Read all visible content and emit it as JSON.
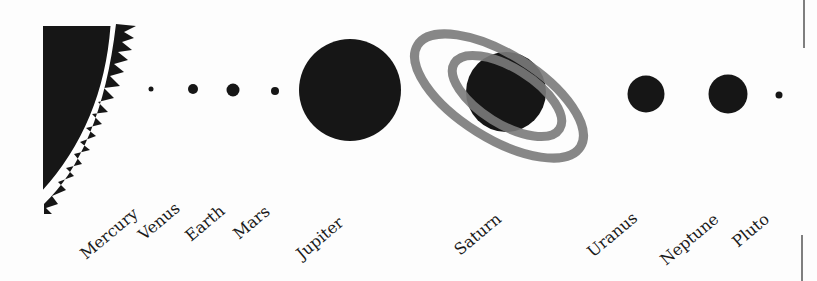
{
  "diagram": {
    "title": "",
    "colors": {
      "body": "#161616",
      "ring": "#7a7a7a",
      "sun_edge": "#ffffff",
      "background": "#fdfdfd",
      "divider": "#555555"
    },
    "sun": {
      "name": "sun",
      "label": ""
    },
    "planets": [
      {
        "name": "Mercury",
        "label": "Mercury"
      },
      {
        "name": "Venus",
        "label": "Venus"
      },
      {
        "name": "Earth",
        "label": "Earth"
      },
      {
        "name": "Mars",
        "label": "Mars"
      },
      {
        "name": "Jupiter",
        "label": "Jupiter"
      },
      {
        "name": "Saturn",
        "label": "Saturn"
      },
      {
        "name": "Uranus",
        "label": "Uranus"
      },
      {
        "name": "Neptune",
        "label": "Neptune"
      },
      {
        "name": "Pluto",
        "label": "Pluto"
      }
    ]
  }
}
